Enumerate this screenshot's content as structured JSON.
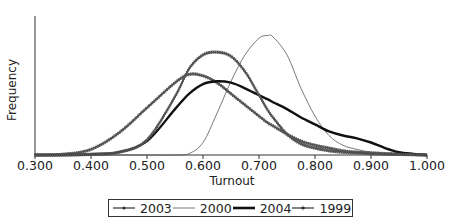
{
  "chart_data": {
    "type": "line",
    "title": "",
    "xlabel": "Turnout",
    "ylabel": "Frequency",
    "xlim": [
      0.3,
      1.0
    ],
    "ylim": [
      0,
      1.0
    ],
    "xticks": [
      "0.300",
      "0.400",
      "0.500",
      "0.600",
      "0.700",
      "0.800",
      "0.900",
      "1.000"
    ],
    "yticks": [],
    "grid": false,
    "legend_position": "bottom",
    "x": [
      0.3,
      0.35,
      0.4,
      0.45,
      0.5,
      0.55,
      0.575,
      0.6,
      0.625,
      0.65,
      0.675,
      0.7,
      0.716,
      0.725,
      0.75,
      0.775,
      0.8,
      0.825,
      0.85,
      0.875,
      0.9,
      0.925,
      0.95,
      0.975,
      1.0
    ],
    "series": [
      {
        "name": "2003",
        "style": "line-with-small-markers",
        "values": [
          0.0,
          0.005,
          0.04,
          0.16,
          0.34,
          0.52,
          0.58,
          0.57,
          0.52,
          0.44,
          0.36,
          0.28,
          0.23,
          0.21,
          0.15,
          0.1,
          0.07,
          0.05,
          0.03,
          0.02,
          0.015,
          0.01,
          0.007,
          0.004,
          0.0
        ]
      },
      {
        "name": "2000",
        "style": "thin-line",
        "values": [
          0.0,
          0.0,
          0.0,
          0.0,
          0.0,
          0.0,
          0.01,
          0.09,
          0.3,
          0.53,
          0.72,
          0.84,
          0.86,
          0.85,
          0.72,
          0.48,
          0.28,
          0.14,
          0.07,
          0.04,
          0.02,
          0.01,
          0.005,
          0.0,
          0.0
        ]
      },
      {
        "name": "2004",
        "style": "thick-line",
        "values": [
          0.0,
          0.0,
          0.005,
          0.02,
          0.1,
          0.33,
          0.44,
          0.51,
          0.53,
          0.52,
          0.48,
          0.43,
          0.4,
          0.38,
          0.33,
          0.27,
          0.22,
          0.17,
          0.14,
          0.12,
          0.09,
          0.05,
          0.02,
          0.008,
          0.0
        ]
      },
      {
        "name": "1999",
        "style": "line-with-star-markers",
        "values": [
          0.0,
          0.0,
          0.005,
          0.02,
          0.11,
          0.42,
          0.62,
          0.72,
          0.74,
          0.71,
          0.6,
          0.43,
          0.32,
          0.27,
          0.15,
          0.08,
          0.05,
          0.03,
          0.02,
          0.015,
          0.01,
          0.006,
          0.004,
          0.002,
          0.0
        ]
      }
    ]
  },
  "legend": [
    {
      "label": "2003"
    },
    {
      "label": "2000"
    },
    {
      "label": "2004"
    },
    {
      "label": "1999"
    }
  ]
}
